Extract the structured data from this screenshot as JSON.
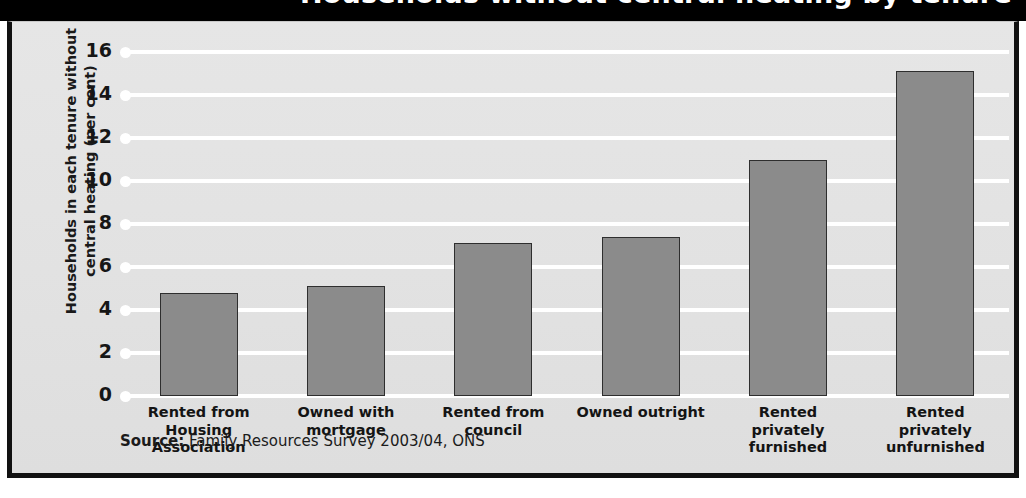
{
  "figure": {
    "title_cropped": "Households without central heating by tenure",
    "source_prefix": "Source:",
    "source_text": " Family Resources Survey 2003/04, ONS",
    "frame_color": "#111111",
    "panel_background": "#e3e3e3",
    "bar_fill": "#8b8b8b",
    "bar_edge": "#2e2e2e",
    "gridline_color": "#ffffff"
  },
  "chart_data": {
    "type": "bar",
    "title": "Households without central heating by tenure",
    "xlabel": "",
    "ylabel": "Households in each tenure without central heating (per cent)",
    "ylim": [
      0,
      16
    ],
    "yticks": [
      0,
      2,
      4,
      6,
      8,
      10,
      12,
      14,
      16
    ],
    "ytick_labels": [
      "0",
      "2",
      "4",
      "6",
      "8",
      "10",
      "12",
      "14",
      "16"
    ],
    "grid": true,
    "legend": false,
    "categories": [
      "Rented from\nHousing\nAssociation",
      "Owned with\nmortgage",
      "Rented from\ncouncil",
      "Owned outright",
      "Rented\nprivately\nfurnished",
      "Rented\nprivately\nunfurnished"
    ],
    "values": [
      4.8,
      5.1,
      7.1,
      7.4,
      11.0,
      15.1
    ],
    "source": "Family Resources Survey 2003/04, ONS"
  }
}
